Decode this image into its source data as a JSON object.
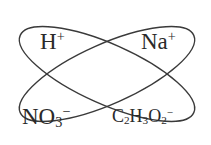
{
  "diagram": {
    "type": "overlapping-ellipses",
    "stroke_color": "#3a3a3a",
    "text_color": "#2a2a2a",
    "ellipses": [
      {
        "name": "ellipse-h-acetate",
        "members": [
          "H+",
          "C2H3O2-"
        ]
      },
      {
        "name": "ellipse-na-nitrate",
        "members": [
          "Na+",
          "NO3-"
        ]
      }
    ],
    "labels": {
      "h": {
        "base": "H",
        "sup": "+"
      },
      "na": {
        "base": "Na",
        "sup": "+"
      },
      "no3": {
        "base1": "NO",
        "sub1": "3",
        "sup": "−"
      },
      "c2h3o2": {
        "base1": "C",
        "sub1": "2",
        "base2": "H",
        "sub2": "3",
        "base3": "O",
        "sub3": "2",
        "sup": "−"
      }
    }
  }
}
